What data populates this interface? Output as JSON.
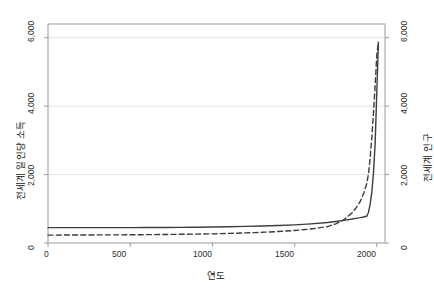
{
  "chart_data": {
    "type": "line",
    "title": "",
    "xlabel": "연도",
    "ylabel": "전세계 일인당 소득",
    "ylabel_right": "전세계 인구",
    "xlim": [
      0,
      2050
    ],
    "ylim": [
      0,
      6400
    ],
    "xticks": [
      0,
      500,
      1000,
      1500,
      2000
    ],
    "xtick_labels": [
      "0",
      "500",
      "1000",
      "1500",
      "2000"
    ],
    "yticks": [
      0,
      2000,
      4000,
      6000
    ],
    "ytick_labels": [
      "0",
      "2,000",
      "4,000",
      "6,000"
    ],
    "ytick_labels_right": [
      "0",
      "2,000",
      "4,000",
      "6,000"
    ],
    "grid": true,
    "grid_color": "#e4e4e4",
    "legend": "none",
    "frame_color": "#9a9a9a",
    "series": [
      {
        "name": "전세계 일인당 소득",
        "style": "solid",
        "color": "#3d3d3d",
        "axis": "left",
        "x": [
          0,
          100,
          200,
          300,
          400,
          500,
          600,
          700,
          800,
          900,
          1000,
          1100,
          1200,
          1300,
          1400,
          1500,
          1600,
          1700,
          1750,
          1800,
          1850,
          1870,
          1900,
          1920,
          1940,
          1950,
          1960,
          1970,
          1980,
          1990,
          2000,
          2010
        ],
        "y": [
          450,
          450,
          450,
          450,
          450,
          450,
          452,
          455,
          458,
          462,
          468,
          475,
          485,
          495,
          510,
          530,
          560,
          600,
          630,
          660,
          700,
          720,
          740,
          760,
          790,
          900,
          1150,
          1500,
          2050,
          2900,
          4400,
          5870
        ]
      },
      {
        "name": "전세계 인구",
        "style": "dashed",
        "color": "#3d3d3d",
        "axis": "right",
        "x": [
          0,
          100,
          200,
          300,
          400,
          500,
          600,
          700,
          800,
          900,
          1000,
          1100,
          1200,
          1300,
          1400,
          1500,
          1600,
          1700,
          1750,
          1800,
          1850,
          1870,
          1900,
          1920,
          1940,
          1950,
          1960,
          1970,
          1980,
          1990,
          2000,
          2010
        ],
        "y": [
          230,
          232,
          234,
          236,
          238,
          240,
          244,
          248,
          254,
          260,
          268,
          280,
          295,
          312,
          335,
          365,
          410,
          480,
          560,
          680,
          880,
          1000,
          1220,
          1450,
          1750,
          2050,
          2500,
          3100,
          3800,
          4600,
          5500,
          5870
        ]
      }
    ]
  },
  "axes": {
    "xlabel": "연도",
    "ylabel_left": "전세계 일인당 소득",
    "ylabel_right": "전세계 인구",
    "xtick_0": "0",
    "xtick_1": "500",
    "xtick_2": "1000",
    "xtick_3": "1500",
    "xtick_4": "2000",
    "ytick_0": "0",
    "ytick_1": "2,000",
    "ytick_2": "4,000",
    "ytick_3": "6,000",
    "ytick_r0": "0",
    "ytick_r1": "2,000",
    "ytick_r2": "4,000",
    "ytick_r3": "6,000"
  }
}
